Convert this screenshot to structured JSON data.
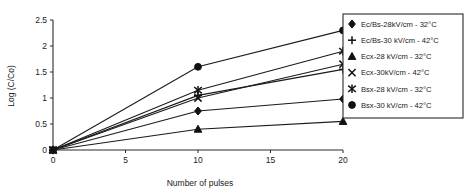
{
  "chart_data": {
    "type": "line",
    "title": "",
    "xlabel": "Number of pulses",
    "ylabel": "Log (C/Co)",
    "x": [
      0,
      10,
      20
    ],
    "xlim": [
      0,
      20
    ],
    "ylim": [
      0,
      2.5
    ],
    "xticks": [
      "0",
      "5",
      "10",
      "15",
      "20"
    ],
    "xtick_values": [
      0,
      5,
      10,
      15,
      20
    ],
    "yticks": [
      "0",
      "0.5",
      "1",
      "1.5",
      "2",
      "2.5"
    ],
    "ytick_values": [
      0,
      0.5,
      1,
      1.5,
      2,
      2.5
    ],
    "grid": false,
    "legend_position": "top-right",
    "series": [
      {
        "name": "Ec/Bs-28kV/cm - 32°C",
        "marker": "filled-diamond",
        "values": [
          0,
          0.75,
          0.98
        ]
      },
      {
        "name": "Ec/Bs-30 kV/cm - 42°C",
        "marker": "plus",
        "values": [
          0,
          1.05,
          1.55
        ]
      },
      {
        "name": "Ecx-28 kV/cm - 32°C",
        "marker": "filled-triangle",
        "values": [
          0,
          0.4,
          0.55
        ]
      },
      {
        "name": "Ecx-30kV/cm - 42°C",
        "marker": "cross-x",
        "values": [
          0,
          1.0,
          1.65
        ]
      },
      {
        "name": "Bsx-28 kV/cm - 32°C",
        "marker": "asterisk",
        "values": [
          0,
          1.15,
          1.9
        ]
      },
      {
        "name": "Bsx-30 kV/cm - 42°C",
        "marker": "filled-circle",
        "values": [
          0,
          1.6,
          2.3
        ]
      }
    ],
    "colors": {
      "line": "#1a1a1a",
      "marker": "#111111",
      "axis": "#2b2b2b",
      "background": "#ffffff"
    }
  }
}
